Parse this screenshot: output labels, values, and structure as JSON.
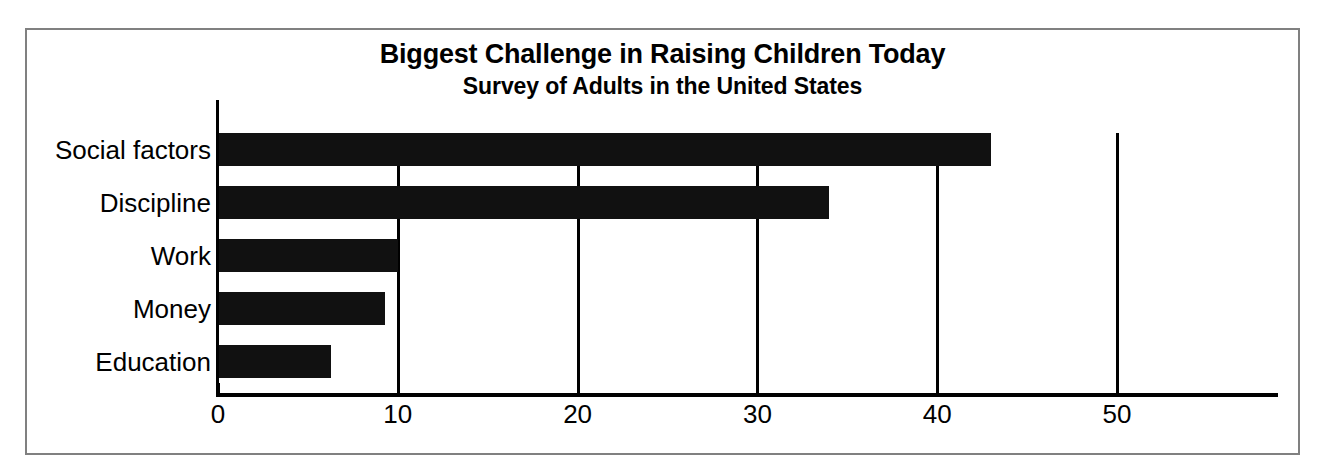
{
  "chart_data": {
    "type": "bar",
    "orientation": "horizontal",
    "title": "Biggest Challenge in Raising Children Today",
    "subtitle": "Survey of Adults in the United States",
    "xlabel": "",
    "ylabel": "",
    "categories": [
      "Social factors",
      "Discipline",
      "Work",
      "Money",
      "Education"
    ],
    "values": [
      43,
      34,
      10,
      9.3,
      6.3
    ],
    "xlim": [
      0,
      57
    ],
    "xticks": [
      0,
      10,
      20,
      30,
      40,
      50
    ],
    "xtick_labels": [
      "0",
      "10",
      "20",
      "30",
      "40",
      "50"
    ],
    "grid": "vertical-only",
    "legend": "none",
    "bar_color": "#111111",
    "background_color": "#ffffff",
    "frame_color": "#808080"
  },
  "axis": {
    "tick_labels": [
      "0",
      "10",
      "20",
      "30",
      "40",
      "50"
    ]
  },
  "bars": [
    {
      "label": "Social factors",
      "value": 43
    },
    {
      "label": "Discipline",
      "value": 34
    },
    {
      "label": "Work",
      "value": 10
    },
    {
      "label": "Money",
      "value": 9.3
    },
    {
      "label": "Education",
      "value": 6.3
    }
  ]
}
